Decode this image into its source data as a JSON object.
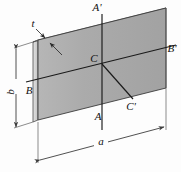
{
  "figure": {
    "background_color": "#fdfdfd",
    "plate": {
      "face_color": "#a9a9a9",
      "face_color_light": "#bdbdbd",
      "edge_color": "#d2d2d2",
      "outline_color": "#3a3a3a"
    },
    "axis_color": "#1a1a1a",
    "dimension_color": "#4a4a4a"
  },
  "labels": {
    "axis_a_top": "A'",
    "axis_a_bottom": "A",
    "axis_b_left": "B",
    "axis_b_right": "B'",
    "axis_c_center": "C",
    "axis_c_end": "C'",
    "thickness": "t",
    "height": "b",
    "width": "a"
  }
}
